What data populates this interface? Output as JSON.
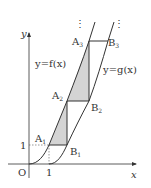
{
  "diagram": {
    "title": "",
    "axes": {
      "x_label": "x",
      "y_label": "y",
      "origin_label": "O",
      "x_tick_label": "1",
      "y_tick_label": "1"
    },
    "curves": [
      {
        "name": "f",
        "label": "y=f(x)"
      },
      {
        "name": "g",
        "label": "y=g(x)"
      }
    ],
    "points": [
      {
        "name": "A1",
        "base": "A",
        "sub": "1"
      },
      {
        "name": "B1",
        "base": "B",
        "sub": "1"
      },
      {
        "name": "A2",
        "base": "A",
        "sub": "2"
      },
      {
        "name": "B2",
        "base": "B",
        "sub": "2"
      },
      {
        "name": "A3",
        "base": "A",
        "sub": "3"
      },
      {
        "name": "B3",
        "base": "B",
        "sub": "3"
      }
    ],
    "continuation_marks": "⋮",
    "shading_color": "#d4d4d4",
    "line_color": "#333333"
  }
}
